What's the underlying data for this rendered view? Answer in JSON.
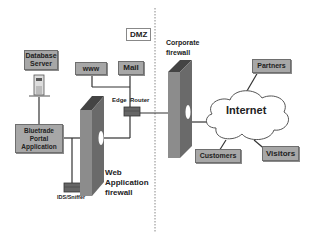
{
  "diagram": {
    "zones": {
      "dmz": "DMZ"
    },
    "nodes": {
      "database_server": "Database Server",
      "www": "www",
      "mail": "Mail",
      "edge_router": "Edge  Router",
      "corporate_firewall": "Corporate firewall",
      "partners": "Partners",
      "internet": "Internet",
      "portal_app": "Bluetrade Portal Application",
      "web_app_firewall": "Web Application firewall",
      "ids_sniffer": "IDS/Sniffer",
      "customers": "Customers",
      "visitors": "Visitors"
    },
    "colors": {
      "box_fill": "#a7a7a7",
      "firewall_fill": "#888888",
      "line": "#333333",
      "cloud_fill": "#ffffff"
    }
  }
}
